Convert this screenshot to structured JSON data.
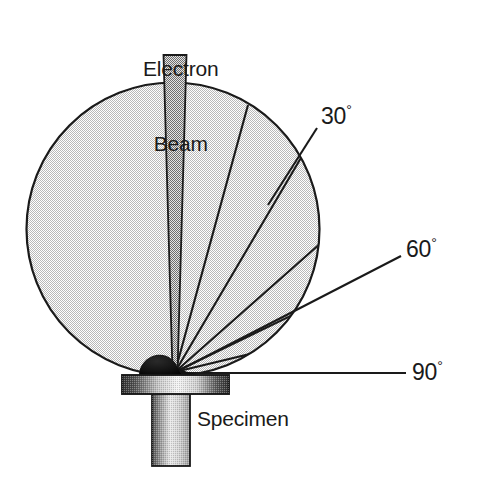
{
  "figure": {
    "title_text": "Electron Beam",
    "beam_label_line1": "Electron",
    "beam_label_line2": "Beam",
    "specimen_label": "Specimen",
    "angle_labels": [
      {
        "name": "takeoff-angle-30",
        "value": "30",
        "degree_symbol": "°"
      },
      {
        "name": "takeoff-angle-60",
        "value": "60",
        "degree_symbol": "°"
      },
      {
        "name": "takeoff-angle-90",
        "value": "90",
        "degree_symbol": "°"
      }
    ],
    "colors": {
      "stroke": "#1a1a1a",
      "sphere_fill": "#dcdcdc",
      "beam_fill": "#9a9a9a",
      "stub_dark": "#2b2b2b",
      "stub_light": "#f2f2f2",
      "blob_fill": "#111111",
      "background": "#ffffff"
    },
    "geometry": {
      "sphere_center_x": 173,
      "sphere_center_y": 229,
      "sphere_radius": 147,
      "impact_point_x": 175,
      "impact_point_y": 372,
      "beam_top_y": 55,
      "beam_top_left_x": 163,
      "beam_top_right_x": 187,
      "stub_plate_left": 122,
      "stub_plate_right": 229,
      "stub_plate_top": 375,
      "stub_plate_bottom": 393,
      "stub_stem_left": 152,
      "stub_stem_right": 190,
      "stub_stem_bottom": 466,
      "horizon_line_y": 373,
      "horizon_line_right_x": 401
    }
  }
}
